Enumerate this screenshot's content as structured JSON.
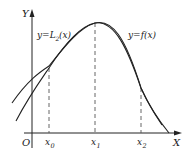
{
  "diagram": {
    "axes": {
      "y_label": "Y",
      "x_label": "X",
      "origin_label": "O"
    },
    "x_ticks": [
      {
        "name": "x",
        "sub": "0"
      },
      {
        "name": "x",
        "sub": "1"
      },
      {
        "name": "x",
        "sub": "2"
      }
    ],
    "curves": [
      {
        "label_main": "y=L",
        "label_sub": "2",
        "label_tail": "(x)",
        "description": "quadratic interpolation polynomial"
      },
      {
        "label_main": "y=f(x)",
        "description": "original function"
      }
    ],
    "colors": {
      "stroke": "#222222",
      "dashed": "#555555",
      "background": "#ffffff"
    }
  }
}
